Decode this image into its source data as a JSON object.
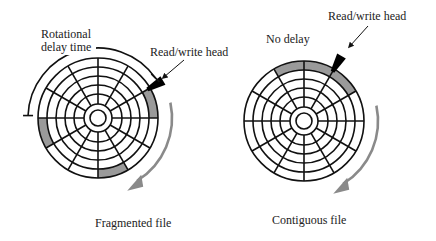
{
  "colors": {
    "line": "#111111",
    "shade": "#9a9a9a",
    "arrow": "#8a8a8a",
    "head": "#000000",
    "text": "#222222",
    "background": "#ffffff"
  },
  "disk_geometry": {
    "tracks": 5,
    "sectors": 12,
    "hub_radius": 8,
    "ring_radii": [
      14,
      24,
      33,
      42,
      51,
      60
    ]
  },
  "diagrams": [
    {
      "id": "fragmented",
      "caption": "Fragmented file",
      "center": [
        98,
        118
      ],
      "shaded_outer_sectors_deg": [
        [
          0,
          30
        ],
        [
          180,
          210
        ],
        [
          270,
          300
        ]
      ],
      "head_angle_deg": 30,
      "head_label": "Read/write head",
      "delay_label_line1": "Rotational",
      "delay_label_line2": "delay time",
      "delay_arc_deg": [
        35,
        178
      ]
    },
    {
      "id": "contiguous",
      "caption": "Contiguous file",
      "center": [
        304,
        121
      ],
      "shaded_outer_sectors_deg": [
        [
          30,
          60
        ],
        [
          60,
          90
        ],
        [
          90,
          120
        ]
      ],
      "head_angle_deg": 60,
      "head_label": "Read/write head",
      "delay_label": "No delay"
    }
  ]
}
